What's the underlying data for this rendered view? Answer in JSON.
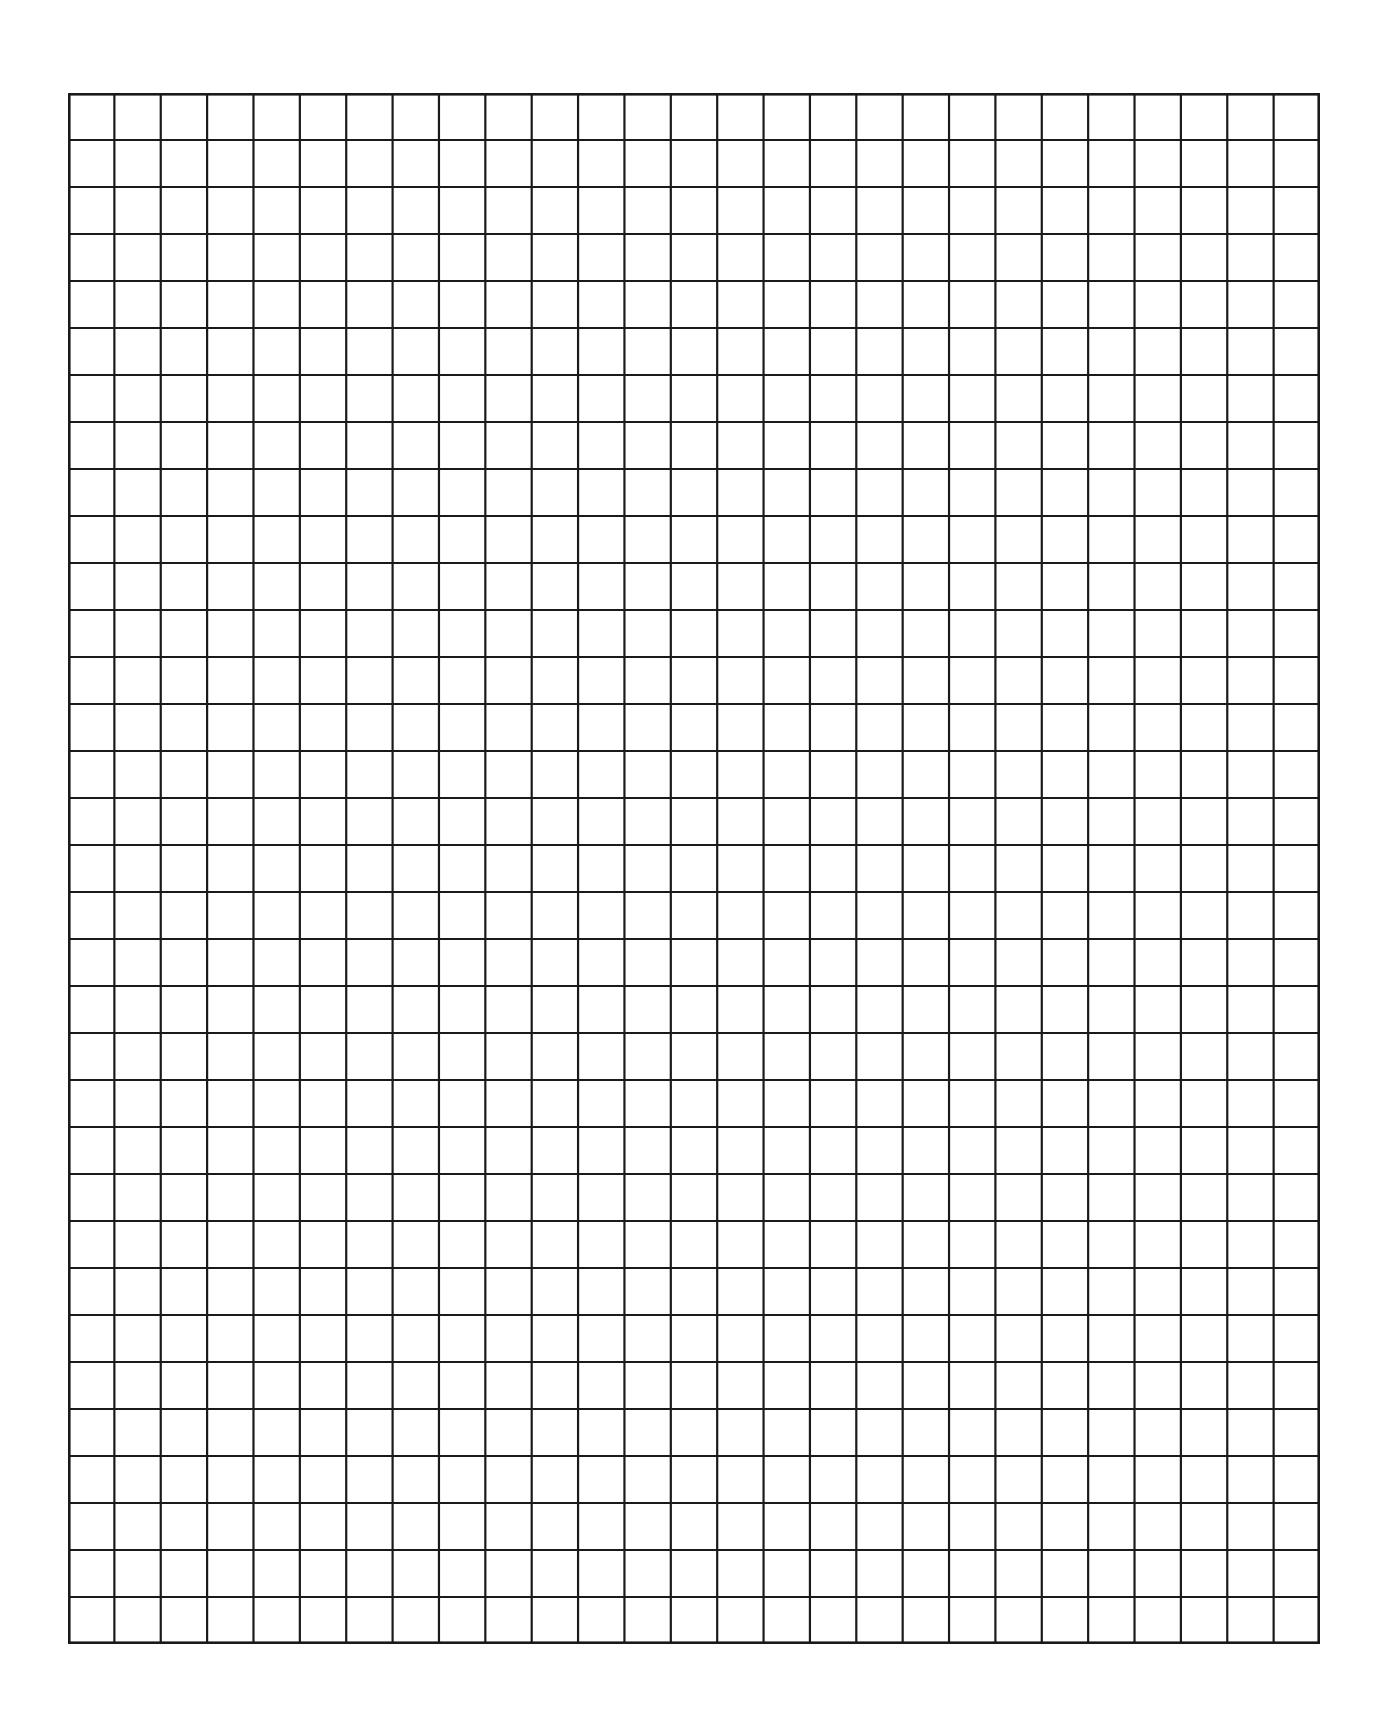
{
  "page": {
    "type": "blank-graph-paper",
    "background": "#ffffff"
  },
  "grid": {
    "columns": 27,
    "rows": 33,
    "line_color": "#1a1a1a",
    "line_width": 2.2,
    "border_width": 2.6,
    "left": 68,
    "top": 93,
    "width": 1252,
    "height": 1551
  }
}
